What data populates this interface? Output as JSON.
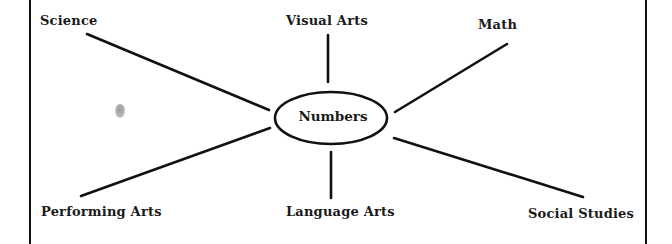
{
  "diagram": {
    "type": "concept-web",
    "center": {
      "label": "Numbers",
      "shape": "ellipse",
      "cx": 331,
      "cy": 118,
      "rx": 56,
      "ry": 26
    },
    "branches": [
      {
        "id": "science",
        "label": "Science",
        "line": [
          87,
          34,
          269,
          110
        ]
      },
      {
        "id": "visual-arts",
        "label": "Visual Arts",
        "line": [
          328,
          35,
          328,
          82
        ]
      },
      {
        "id": "math",
        "label": "Math",
        "line": [
          395,
          112,
          507,
          44
        ]
      },
      {
        "id": "performing-arts",
        "label": "Performing Arts",
        "line": [
          81,
          196,
          270,
          128
        ]
      },
      {
        "id": "language-arts",
        "label": "Language Arts",
        "line": [
          331,
          152,
          331,
          198
        ]
      },
      {
        "id": "social-studies",
        "label": "Social Studies",
        "line": [
          394,
          138,
          583,
          197
        ]
      }
    ],
    "colors": {
      "ink": "#111111",
      "background": "#ffffff",
      "smudge": "#9a9a9a"
    }
  }
}
